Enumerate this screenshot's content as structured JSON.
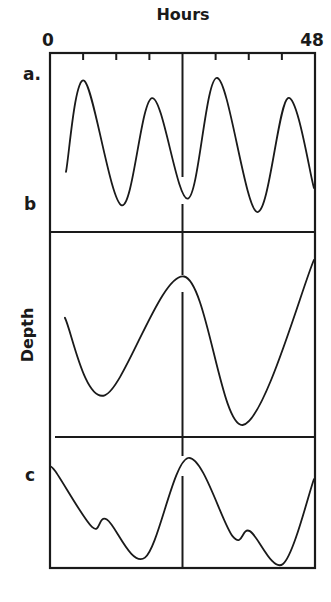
{
  "chart_data": {
    "type": "line",
    "title": "Hours",
    "xlabel": "Hours",
    "ylabel": "Depth",
    "xlim": [
      0,
      48
    ],
    "x_tick_labels": [
      "0",
      "48"
    ],
    "x_ticks": [
      6,
      12,
      18,
      24,
      30,
      36,
      42
    ],
    "grid": false,
    "panels": [
      {
        "name": "a",
        "label": "a.",
        "description": "semidiurnal tide (two highs and two lows per day)",
        "x": [
          2.9,
          6.2,
          13.0,
          18.5,
          25.0,
          30.3,
          37.5,
          43.1,
          47.8
        ],
        "y": [
          0.3,
          0.98,
          0.05,
          0.85,
          0.1,
          1.0,
          0.0,
          0.85,
          0.18
        ]
      },
      {
        "name": "b",
        "label": "b",
        "description": "diurnal tide (one high and one low per day)",
        "x": [
          2.7,
          9.9,
          24.3,
          34.9,
          47.8
        ],
        "y": [
          0.65,
          0.18,
          0.9,
          0.0,
          1.0
        ]
      },
      {
        "name": "c",
        "label": "c",
        "description": "mixed tide",
        "x": [
          0.0,
          0.9,
          7.6,
          10.3,
          17.2,
          25.0,
          33.1,
          36.2,
          42.2,
          47.8
        ],
        "y": [
          0.88,
          0.88,
          0.35,
          0.42,
          0.06,
          1.0,
          0.26,
          0.31,
          0.0,
          0.8
        ]
      }
    ]
  }
}
